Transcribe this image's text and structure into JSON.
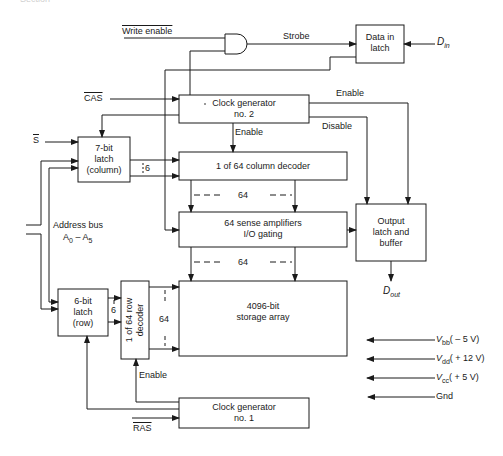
{
  "header": {
    "partial_text": "Section"
  },
  "blocks": {
    "data_in_latch": {
      "line1": "Data in",
      "line2": "latch"
    },
    "clock_gen_2": {
      "line1": "Clock generator",
      "line2": "no. 2"
    },
    "latch_column": {
      "line1": "7-bit",
      "line2": "latch",
      "line3": "(column)"
    },
    "column_decoder": {
      "label": "1 of 64 column decoder"
    },
    "sense_amps": {
      "line1": "64 sense amplifiers",
      "line2": "I/O gating"
    },
    "output_latch": {
      "line1": "Output",
      "line2": "latch and",
      "line3": "buffer"
    },
    "latch_row": {
      "line1": "6-bit",
      "line2": "latch",
      "line3": "(row)"
    },
    "row_decoder": {
      "line1": "1 of 64 row",
      "line2": "decoder"
    },
    "storage_array": {
      "line1": "4096-bit",
      "line2": "storage array"
    },
    "clock_gen_1": {
      "line1": "Clock generator",
      "line2": "no. 1"
    }
  },
  "signals": {
    "write_enable": "Write enable",
    "strobe": "Strobe",
    "d_in": "D",
    "d_in_sub": "in",
    "cas": "CAS",
    "enable_top": "Enable",
    "disable": "Disable",
    "enable_col": "Enable",
    "s_bar": "S",
    "bus_6_col": "6",
    "bus_64_a": "64",
    "bus_64_b": "64",
    "address_bus": "Address bus",
    "address_range_a": "A",
    "address_range_a_sub": "0",
    "address_range_dash": " – ",
    "address_range_b": "A",
    "address_range_b_sub": "5",
    "d_out": "D",
    "d_out_sub": "out",
    "bus_6_row": "6",
    "bus_64_row": "64",
    "enable_row": "Enable",
    "ras": "RAS"
  },
  "power": [
    {
      "name": "V",
      "sub": "bb",
      "value": "( – 5 V)"
    },
    {
      "name": "V",
      "sub": "dd",
      "value": "( + 12 V)"
    },
    {
      "name": "V",
      "sub": "cc",
      "value": "( + 5 V)"
    },
    {
      "name": "Gnd",
      "sub": "",
      "value": ""
    }
  ]
}
